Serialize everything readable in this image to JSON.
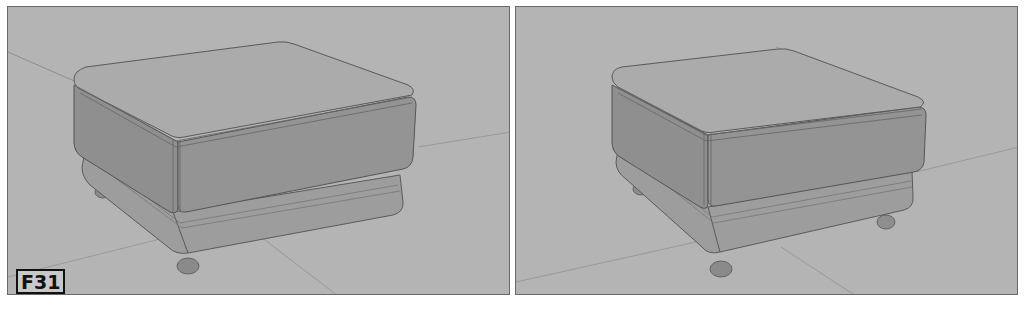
{
  "figure": {
    "label": "F31",
    "background": "#b4b4b4",
    "panels": [
      {
        "id": "left",
        "subject": "ottoman-render"
      },
      {
        "id": "right",
        "subject": "ottoman-render"
      }
    ]
  }
}
